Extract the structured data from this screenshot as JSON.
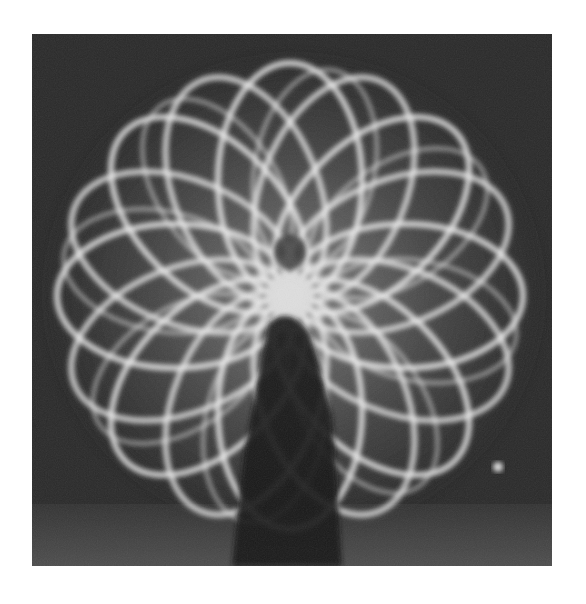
{
  "image": {
    "kind": "photograph",
    "description": "Black-and-white long-exposure light painting: a person spinning lights creating a flower-like rosette of overlapping loops",
    "colors": {
      "page_background": "#ffffff",
      "photo_background": "#2a2a2a",
      "light_trails": "#e8e8e8",
      "figure": "#151515",
      "floor_reflection": "#5a5a5a"
    },
    "frame": {
      "x": 32,
      "y": 34,
      "width": 520,
      "height": 532
    },
    "subject": {
      "rosette_center": [
        258,
        250
      ],
      "loop_count": 16,
      "figure_position": "bottom-center",
      "bright_spot": [
        498,
        467
      ]
    }
  }
}
